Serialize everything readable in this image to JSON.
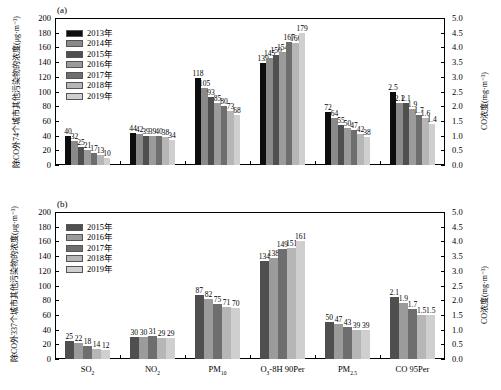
{
  "figure": {
    "panel_a_tag": "(a)",
    "panel_b_tag": "(b)",
    "panel_a_city_note": "74个城市",
    "panel_b_city_note": "337个城市",
    "xlabel": "污染物",
    "ylabel_left_a": "除CO外74个城市其他污染物的浓度(μg·m⁻³)",
    "ylabel_left_b": "除CO外337个城市其他污染物的浓度(μg·m⁻³)",
    "ylabel_right": "CO浓度(mg·m⁻³)"
  },
  "colors": {
    "y2013": "#0d0d0d",
    "y2014": "#8a8a8a",
    "y2015": "#4f4f4f",
    "y2016": "#9b9b9b",
    "y2017": "#6e6e6e",
    "y2018": "#b6b6b6",
    "y2019": "#cfcfcf"
  },
  "chart_data": [
    {
      "type": "bar",
      "panel": "(a)",
      "title": "74个城市",
      "xlabel": "污染物",
      "ylabel": "除CO外74个城市其他污染物的浓度(μg·m⁻³)",
      "ylabel_secondary": "CO浓度(mg·m⁻³)",
      "ylim": [
        0,
        200
      ],
      "yticks": [
        "0",
        "20",
        "40",
        "60",
        "80",
        "100",
        "120",
        "140",
        "160",
        "180",
        "200"
      ],
      "ylim_secondary": [
        0,
        5
      ],
      "yticks_secondary": [
        "0.0",
        "0.5",
        "1.0",
        "1.5",
        "2.0",
        "2.5",
        "3.0",
        "3.5",
        "4.0",
        "4.5",
        "5.0"
      ],
      "grid": false,
      "legend_position": "upper-left",
      "categories": [
        "SO₂",
        "NO₂",
        "PM₁₀",
        "O₃-8H 90Per",
        "PM₂.₅",
        "CO 95Per"
      ],
      "secondary_axis_categories": [
        "CO 95Per"
      ],
      "series": [
        {
          "name": "2013年",
          "values": [
            40,
            44,
            118,
            139,
            72,
            2.5
          ]
        },
        {
          "name": "2014年",
          "values": [
            32,
            42,
            105,
            145,
            64,
            2.1
          ]
        },
        {
          "name": "2015年",
          "values": [
            25,
            39,
            93,
            150,
            55,
            2.1
          ]
        },
        {
          "name": "2016年",
          "values": [
            21,
            39,
            85,
            154,
            50,
            1.9
          ]
        },
        {
          "name": "2017年",
          "values": [
            17,
            40,
            80,
            167,
            47,
            1.7
          ]
        },
        {
          "name": "2018年",
          "values": [
            13,
            38,
            73,
            166,
            42,
            1.6
          ]
        },
        {
          "name": "2019年",
          "values": [
            10,
            34,
            68,
            179,
            38,
            1.4
          ]
        }
      ]
    },
    {
      "type": "bar",
      "panel": "(b)",
      "title": "337个城市",
      "xlabel": "污染物",
      "ylabel": "除CO外337个城市其他污染物的浓度(μg·m⁻³)",
      "ylabel_secondary": "CO浓度(mg·m⁻³)",
      "ylim": [
        0,
        200
      ],
      "yticks": [
        "0",
        "20",
        "40",
        "60",
        "80",
        "100",
        "120",
        "140",
        "160",
        "180",
        "200"
      ],
      "ylim_secondary": [
        0,
        5
      ],
      "yticks_secondary": [
        "0.0",
        "0.5",
        "1.0",
        "1.5",
        "2.0",
        "2.5",
        "3.0",
        "3.5",
        "4.0",
        "4.5",
        "5.0"
      ],
      "grid": false,
      "legend_position": "upper-left",
      "categories": [
        "SO₂",
        "NO₂",
        "PM₁₀",
        "O₃-8H 90Per",
        "PM₂.₅",
        "CO 95Per"
      ],
      "secondary_axis_categories": [
        "CO 95Per"
      ],
      "series": [
        {
          "name": "2015年",
          "values": [
            25,
            30,
            87,
            134,
            50,
            2.1
          ]
        },
        {
          "name": "2016年",
          "values": [
            22,
            30,
            82,
            138,
            47,
            1.9
          ]
        },
        {
          "name": "2017年",
          "values": [
            18,
            31,
            75,
            149,
            43,
            1.7
          ]
        },
        {
          "name": "2018年",
          "values": [
            14,
            29,
            71,
            151,
            39,
            1.5
          ]
        },
        {
          "name": "2019年",
          "values": [
            12,
            29,
            70,
            161,
            39,
            1.5
          ]
        }
      ]
    }
  ]
}
